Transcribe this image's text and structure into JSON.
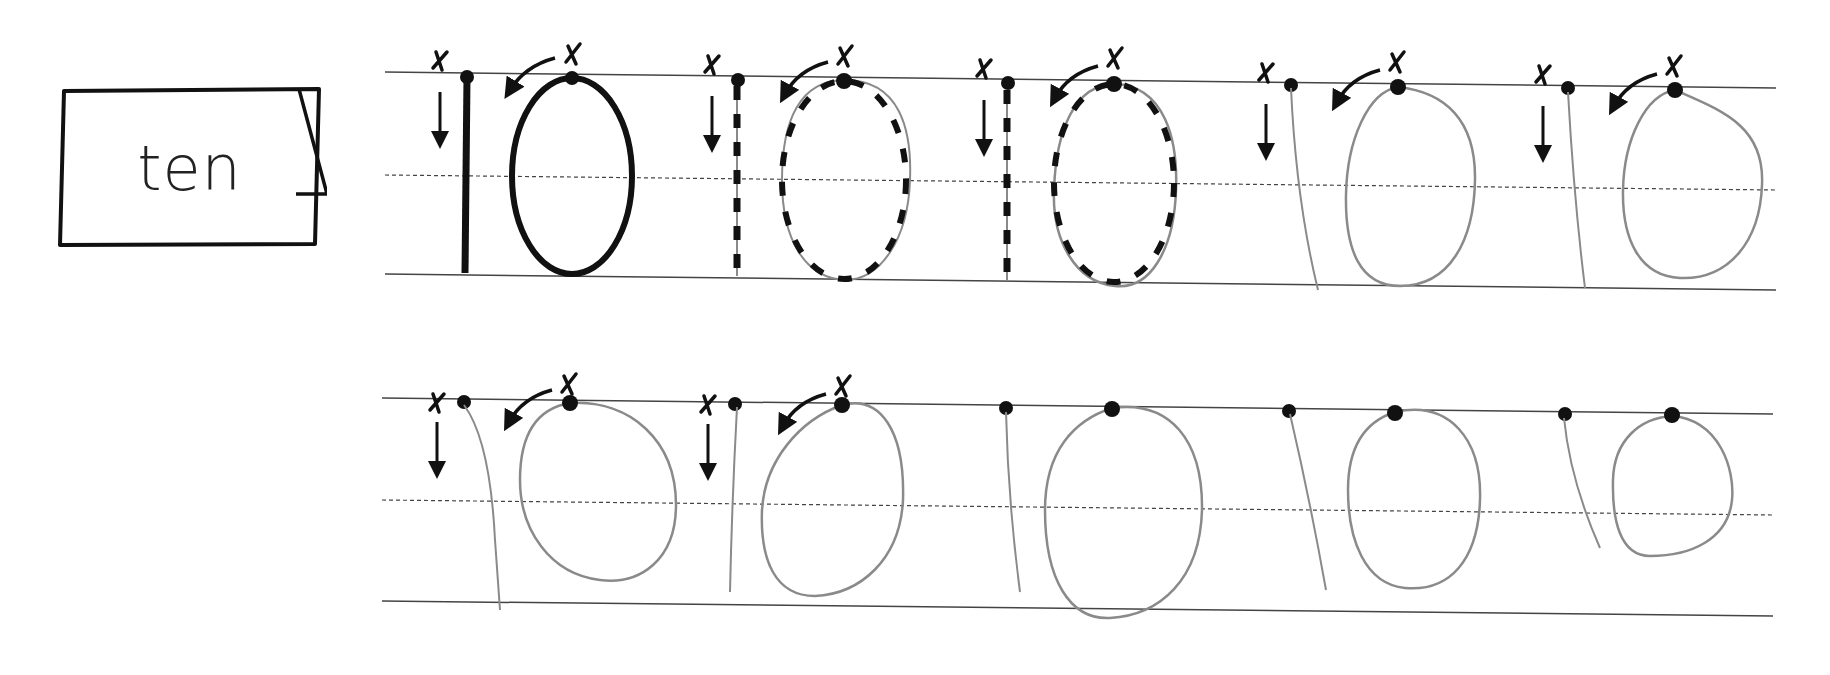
{
  "card": {
    "word": "ten"
  },
  "practice": {
    "numeral": "10",
    "start_marker": "x",
    "rows": [
      {
        "index": 1,
        "cells": [
          {
            "style": "solid-model",
            "has_start_marks": true
          },
          {
            "style": "dashed-trace",
            "has_start_marks": true
          },
          {
            "style": "dashed-trace",
            "has_start_marks": true
          },
          {
            "style": "dots-only-handwritten",
            "has_start_marks": true
          },
          {
            "style": "dots-only-handwritten",
            "has_start_marks": true
          }
        ]
      },
      {
        "index": 2,
        "cells": [
          {
            "style": "dots-only-handwritten",
            "has_start_marks": true
          },
          {
            "style": "dots-only-handwritten",
            "has_start_marks": true
          },
          {
            "style": "dots-only-handwritten",
            "has_start_marks": false
          },
          {
            "style": "dots-only-handwritten",
            "has_start_marks": false
          },
          {
            "style": "dots-only-handwritten",
            "has_start_marks": false
          }
        ]
      }
    ]
  },
  "colors": {
    "ink": "#111111",
    "rule": "#444444",
    "pencil": "#8a8a8a"
  }
}
